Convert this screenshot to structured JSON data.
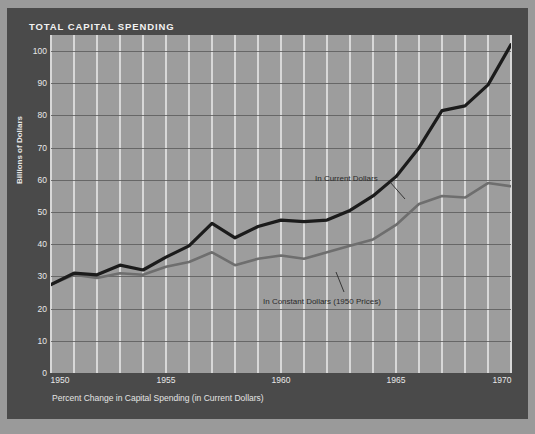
{
  "title": "TOTAL CAPITAL SPENDING",
  "caption": "Percent Change in Capital Spending (in Current Dollars)",
  "colors": {
    "frame": "#4a4a4a",
    "page": "#9a9a9a",
    "plot_background": "#9d9d9d",
    "vertical_gridline": "#d8d8d8",
    "horizontal_gridline": "#5e5e5e",
    "current_dollars_line": "#1b1b1b",
    "constant_dollars_line": "#6e6e6e",
    "label_text": "#e8e8e8",
    "title_text": "#f2f2f2",
    "annotation_text": "#2a2a2a"
  },
  "annotations": [
    {
      "text": "In Current Dollars",
      "x": 315,
      "y": 174
    },
    {
      "text": "In Constant Dollars (1950 Prices)",
      "x": 263,
      "y": 297
    }
  ],
  "chart_data": {
    "type": "line",
    "title": "TOTAL CAPITAL SPENDING",
    "xlabel": "",
    "ylabel": "Billions of Dollars",
    "caption": "Percent Change in Capital Spending (in Current Dollars)",
    "xlim": [
      1950,
      1970
    ],
    "ylim": [
      0,
      105
    ],
    "ytick_values": [
      0,
      10,
      20,
      30,
      40,
      50,
      60,
      70,
      80,
      90,
      100
    ],
    "ytick_labels": [
      "0",
      "10",
      "20",
      "30",
      "40",
      "50",
      "60",
      "70",
      "80",
      "90",
      "100"
    ],
    "xtick_values": [
      1950,
      1955,
      1960,
      1965,
      1970
    ],
    "xtick_labels": [
      "1950",
      "1955",
      "1960",
      "1965",
      "1970"
    ],
    "x_minor_every": 1,
    "grid": true,
    "grid_vertical": true,
    "grid_horizontal": true,
    "legend": "inline-annotations",
    "x": [
      1950,
      1951,
      1952,
      1953,
      1954,
      1955,
      1956,
      1957,
      1958,
      1959,
      1960,
      1961,
      1962,
      1963,
      1964,
      1965,
      1966,
      1967,
      1968,
      1969,
      1970
    ],
    "series": [
      {
        "name": "In Current Dollars",
        "color": "#1b1b1b",
        "values": [
          27.5,
          31.0,
          30.5,
          33.5,
          32.0,
          36.0,
          39.5,
          46.5,
          42.0,
          45.5,
          47.5,
          47.0,
          47.5,
          50.5,
          55.0,
          61.0,
          70.0,
          81.5,
          83.0,
          89.5,
          102.0
        ]
      },
      {
        "name": "In Constant Dollars (1950 Prices)",
        "color": "#6e6e6e",
        "values": [
          27.5,
          30.5,
          29.5,
          31.0,
          30.5,
          33.0,
          34.5,
          37.5,
          33.5,
          35.5,
          36.5,
          35.5,
          37.5,
          39.5,
          41.5,
          46.0,
          52.5,
          55.0,
          54.5,
          59.0,
          58.0
        ]
      }
    ]
  }
}
